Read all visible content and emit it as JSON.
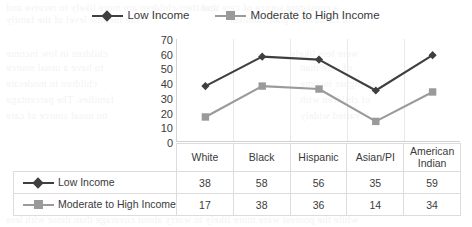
{
  "legend": {
    "items": [
      {
        "label": "Low Income",
        "color": "#3f3f3f",
        "marker": "diamond-marker"
      },
      {
        "label": "Moderate to High Income",
        "color": "#9a9a9a",
        "marker": "square-marker"
      }
    ]
  },
  "axis": {
    "yticks": [
      "70",
      "60",
      "50",
      "40",
      "30",
      "20",
      "10",
      "0"
    ]
  },
  "table": {
    "row_header_blank": "",
    "columns": [
      "White",
      "Black",
      "Hispanic",
      "Asian/PI",
      "American Indian"
    ],
    "rows": [
      {
        "label": "Low Income",
        "values": [
          "38",
          "58",
          "56",
          "35",
          "59"
        ]
      },
      {
        "label": "Moderate to High Income",
        "values": [
          "17",
          "38",
          "36",
          "14",
          "34"
        ]
      }
    ]
  },
  "chart_data": {
    "type": "line",
    "title": "",
    "xlabel": "",
    "ylabel": "",
    "categories": [
      "White",
      "Black",
      "Hispanic",
      "Asian/PI",
      "American Indian"
    ],
    "series": [
      {
        "name": "Low Income",
        "values": [
          38,
          58,
          56,
          35,
          59
        ],
        "color": "#3f3f3f",
        "marker": "diamond"
      },
      {
        "name": "Moderate to High Income",
        "values": [
          17,
          38,
          36,
          14,
          34
        ],
        "color": "#9a9a9a",
        "marker": "square"
      }
    ],
    "ylim": [
      0,
      70
    ],
    "ytick_step": 10,
    "grid": "vertical-only",
    "legend_position": "top"
  }
}
